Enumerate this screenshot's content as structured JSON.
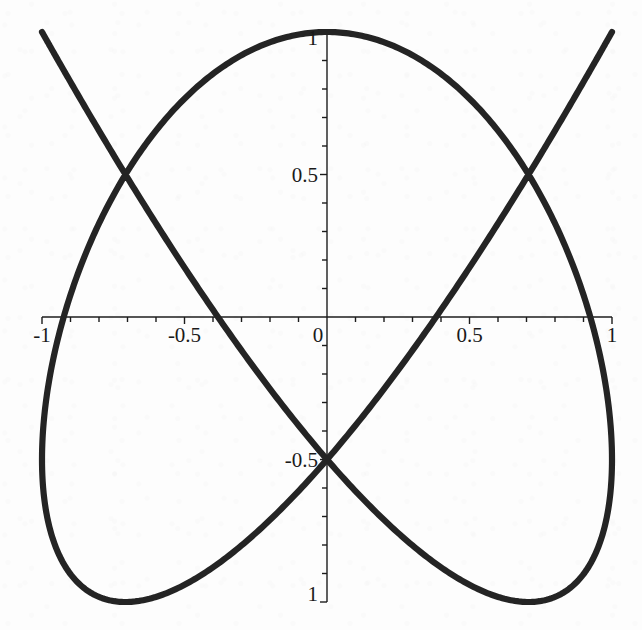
{
  "figure": {
    "title": "",
    "background_color": "#fdfdfd",
    "curve_color": "#242424",
    "axis_color": "#1c1c1c"
  },
  "axes": {
    "x_axis_name": "x-axis",
    "y_axis_name": "y-axis",
    "origin_label": "0",
    "x_tick_labels": [
      {
        "value": -1,
        "text": "-1"
      },
      {
        "value": -0.5,
        "text": "-0.5"
      },
      {
        "value": 0,
        "text": "0"
      },
      {
        "value": 0.5,
        "text": "0.5"
      },
      {
        "value": 1,
        "text": "1"
      }
    ],
    "y_tick_labels": [
      {
        "value": 1,
        "text": "1"
      },
      {
        "value": 0.5,
        "text": "0.5"
      },
      {
        "value": -0.5,
        "text": "-0.5"
      },
      {
        "value": -1,
        "text": "1"
      }
    ],
    "minor_tick_step": 0.1
  },
  "chart_data": {
    "type": "line",
    "title": "",
    "xlabel": "",
    "ylabel": "",
    "xlim": [
      -1,
      1
    ],
    "ylim": [
      -1,
      1
    ],
    "grid": false,
    "legend": null,
    "curve_type": "lissajous",
    "parametric": {
      "x_expression": "sin(3t)",
      "y_expression": "cos(4t)",
      "t_range": [
        0,
        6.283185307179586
      ],
      "frequency_ratio_x": 3,
      "frequency_ratio_y": 4,
      "amplitude_x": 1,
      "amplitude_y": 1,
      "phase": 0,
      "samples": 2000
    },
    "xticks": [
      -1,
      -0.5,
      0,
      0.5,
      1
    ],
    "yticks": [
      -1,
      -0.5,
      0,
      0.5,
      1
    ],
    "x_tick_text": [
      "-1",
      "-0.5",
      "0",
      "0.5",
      "1"
    ],
    "y_tick_text": [
      "-1",
      "-0.5",
      "0",
      "0.5",
      "1"
    ],
    "features": {
      "horizontal_tangents_top": 4,
      "vertical_tangents_left": 3,
      "x_axis_crossings": [
        -0.5,
        0.5
      ],
      "y_axis_crossings": [
        -0.87,
        -0.38,
        0.38,
        0.87
      ]
    }
  },
  "geometry": {
    "origin_px": {
      "x": 327,
      "y": 317
    },
    "unit_px": 285,
    "plot_left_px": 42,
    "plot_right_px": 612,
    "plot_top_px": 32,
    "plot_bottom_px": 602
  }
}
